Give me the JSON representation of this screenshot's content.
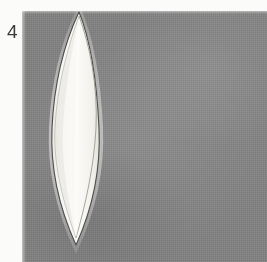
{
  "plate": {
    "figure_number": "4",
    "background_color": "#878787",
    "margin_color": "#fbfbfa",
    "width": 267,
    "height": 262
  },
  "specimen": {
    "name": "lanceolate-specimen",
    "fill_color": "#f6f5f1",
    "outline_color": "#4a4a48",
    "inner_margin_color": "#8e8d88",
    "highlight_color": "#ffffff",
    "shadow_color": "#6b6b6b",
    "apex_x": 79,
    "apex_y": 12,
    "base_x": 76,
    "base_y": 246,
    "widest_left_x": 52,
    "widest_right_x": 100,
    "widest_y": 128
  }
}
